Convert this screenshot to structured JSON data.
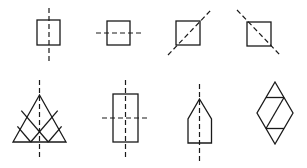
{
  "diagram": {
    "stroke_color": "#1a1a1a",
    "background": "#ffffff",
    "shapes": [
      {
        "id": "square-vertical-axis",
        "type": "square",
        "axis": "vertical"
      },
      {
        "id": "square-horizontal-axis",
        "type": "square",
        "axis": "horizontal"
      },
      {
        "id": "square-diagonal-axis-rising",
        "type": "square",
        "axis": "diagonal-rising"
      },
      {
        "id": "square-diagonal-axis-falling",
        "type": "square",
        "axis": "diagonal-falling"
      },
      {
        "id": "triangle-lattice-vertical-axis",
        "type": "subdivided-triangle",
        "axis": "vertical"
      },
      {
        "id": "rectangle-cross-axes",
        "type": "rectangle",
        "axis": "vertical-and-horizontal"
      },
      {
        "id": "pentagon-vertical-axis",
        "type": "house-pentagon",
        "axis": "vertical"
      },
      {
        "id": "rhombus-subdivided",
        "type": "subdivided-rhombus",
        "axis": "none"
      }
    ]
  }
}
